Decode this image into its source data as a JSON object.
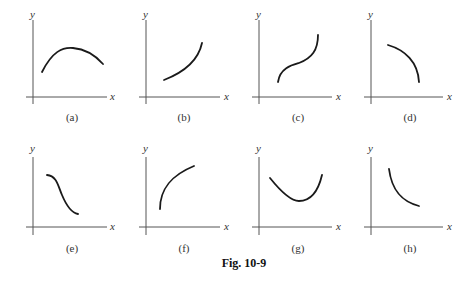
{
  "figure": {
    "caption": "Fig. 10-9",
    "axis_labels": {
      "x": "x",
      "y": "y"
    },
    "panels": [
      {
        "id": "a",
        "label": "(a)",
        "shape": "concave-down arch (rises to a maximum then falls)"
      },
      {
        "id": "b",
        "label": "(b)",
        "shape": "increasing, concave up"
      },
      {
        "id": "c",
        "label": "(c)",
        "shape": "increasing S-curve with inflection"
      },
      {
        "id": "d",
        "label": "(d)",
        "shape": "decreasing, concave down"
      },
      {
        "id": "e",
        "label": "(e)",
        "shape": "decreasing reverse S-curve with inflection"
      },
      {
        "id": "f",
        "label": "(f)",
        "shape": "increasing, concave down"
      },
      {
        "id": "g",
        "label": "(g)",
        "shape": "concave-up valley (falls to a minimum then rises)"
      },
      {
        "id": "h",
        "label": "(h)",
        "shape": "decreasing, concave up"
      }
    ]
  }
}
